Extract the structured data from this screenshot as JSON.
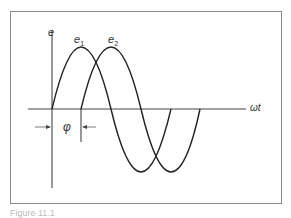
{
  "diagram": {
    "axis_y_label": "e",
    "axis_x_label": "ωt",
    "curve1_label": "e",
    "curve1_sub": "1",
    "curve2_label": "e",
    "curve2_sub": "2",
    "phase_label": "φ",
    "caption": "Figure 11.1",
    "line_color": "#222222"
  }
}
